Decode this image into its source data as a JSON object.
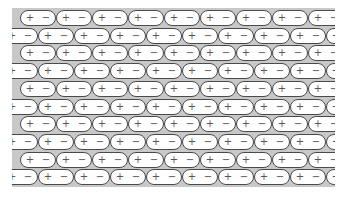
{
  "diagram": {
    "title": "",
    "background_color": "#c8c8c8",
    "capsule_fill": "#ffffff",
    "capsule_stroke": "#4a4a4a",
    "row_count": 10,
    "dipole": {
      "positive": "+",
      "negative": "−"
    },
    "rows": [
      {
        "offset": "full",
        "count": 9
      },
      {
        "offset": "shifted",
        "count": 10
      },
      {
        "offset": "full",
        "count": 9
      },
      {
        "offset": "shifted",
        "count": 10
      },
      {
        "offset": "full",
        "count": 9
      },
      {
        "offset": "shifted",
        "count": 10
      },
      {
        "offset": "full",
        "count": 9
      },
      {
        "offset": "shifted",
        "count": 10
      },
      {
        "offset": "full",
        "count": 9
      },
      {
        "offset": "shifted",
        "count": 10
      }
    ]
  }
}
